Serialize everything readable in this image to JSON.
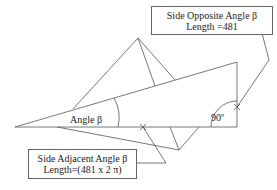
{
  "diagram": {
    "type": "right-triangle-illustration",
    "angle_label": "Angle β",
    "right_angle_label": "90º",
    "opposite_box": {
      "line1": "Side Opposite Angle β",
      "line2": "Length =481"
    },
    "adjacent_box": {
      "line1": "Side Adjacent Angle β",
      "line2": "Length=(481 x 2 π)"
    },
    "colors": {
      "line": "#555555",
      "text": "#222222",
      "background": "#ffffff"
    }
  }
}
